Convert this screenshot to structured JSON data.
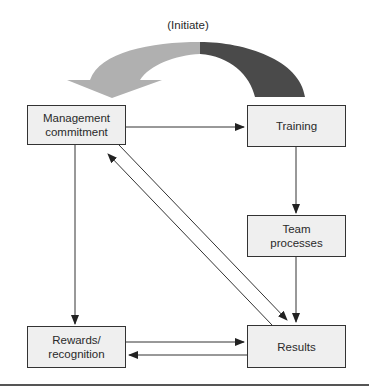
{
  "diagram": {
    "title_label": "(Initiate)",
    "colors": {
      "box_fill": "#efefef",
      "box_border": "#333333",
      "arrow_line": "#333333",
      "initiate_arrow_light": "#b0b0b0",
      "initiate_arrow_dark": "#4a4a4a",
      "rule": "#555555"
    },
    "nodes": [
      {
        "id": "management",
        "label": "Management\ncommitment"
      },
      {
        "id": "training",
        "label": "Training"
      },
      {
        "id": "team",
        "label": "Team\nprocesses"
      },
      {
        "id": "rewards",
        "label": "Rewards/\nrecognition"
      },
      {
        "id": "results",
        "label": "Results"
      }
    ],
    "edges": [
      {
        "from": "training",
        "to": "management",
        "style": "curved-block-arrow",
        "label": "(Initiate)"
      },
      {
        "from": "management",
        "to": "training"
      },
      {
        "from": "management",
        "to": "rewards"
      },
      {
        "from": "management",
        "to": "results"
      },
      {
        "from": "results",
        "to": "management"
      },
      {
        "from": "training",
        "to": "team"
      },
      {
        "from": "team",
        "to": "results"
      },
      {
        "from": "rewards",
        "to": "results"
      },
      {
        "from": "results",
        "to": "rewards"
      }
    ]
  }
}
